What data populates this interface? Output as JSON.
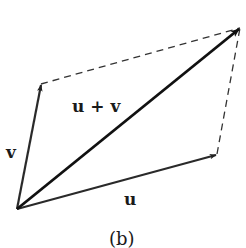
{
  "diagram": {
    "type": "vector-addition-parallelogram",
    "caption": "(b)",
    "labels": {
      "u": "u",
      "v": "v",
      "sum": "u + v"
    },
    "points": {
      "origin": [
        17,
        209
      ],
      "v_tip": [
        41,
        84
      ],
      "u_tip": [
        217,
        154
      ],
      "sum_tip": [
        240,
        28
      ]
    },
    "colors": {
      "vector": "#2a2a2a",
      "sum_vector": "#111111",
      "dashed": "#333333",
      "background": "#ffffff"
    }
  }
}
